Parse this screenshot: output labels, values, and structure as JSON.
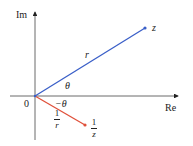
{
  "diagram": {
    "axes": {
      "x_label": "Re",
      "y_label": "Im",
      "origin_label": "0"
    },
    "vectors": [
      {
        "name": "z",
        "label": "z",
        "length_label": "r",
        "angle_label": "θ",
        "color": "#3a5fc8"
      },
      {
        "name": "reciprocal",
        "label_num": "1",
        "label_den": "z",
        "length_num": "1",
        "length_den": "r",
        "angle_label": "−θ",
        "color": "#e0503a"
      }
    ]
  }
}
